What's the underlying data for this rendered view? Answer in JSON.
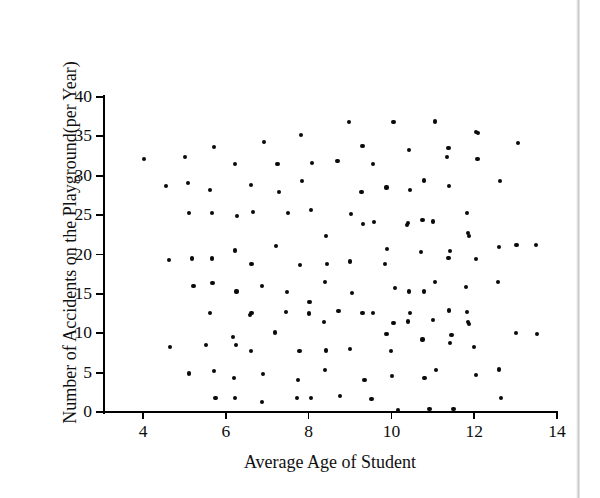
{
  "figure": {
    "background_color": "#ffffff",
    "ink_color": "#0a0a0a",
    "marker_shape": "filled-circle"
  },
  "chart_data": {
    "type": "scatter",
    "title": "",
    "subtitle": "",
    "xlabel": "Average Age of Student",
    "ylabel": "Number of Accidents on the Playground(per Year)",
    "xlim": [
      3.0,
      14.2
    ],
    "ylim": [
      0,
      40.5
    ],
    "xticks": [
      4,
      6,
      8,
      10,
      12,
      14
    ],
    "xtick_labels": [
      "4",
      "6",
      "8",
      "10",
      "12",
      "14"
    ],
    "yticks": [
      0,
      5,
      10,
      15,
      20,
      25,
      30,
      35,
      40
    ],
    "ytick_labels": [
      "0",
      "5",
      "10",
      "15",
      "20",
      "25",
      "30",
      "35",
      "40"
    ],
    "grid": false,
    "legend": null,
    "annotations": [],
    "relationship": "no apparent correlation",
    "n_points": 160,
    "points": [
      [
        4.02,
        32.1
      ],
      [
        4.55,
        28.7
      ],
      [
        4.62,
        19.3
      ],
      [
        4.66,
        8.3
      ],
      [
        5.02,
        32.4
      ],
      [
        5.08,
        29.1
      ],
      [
        5.12,
        25.3
      ],
      [
        5.18,
        19.5
      ],
      [
        5.22,
        16.0
      ],
      [
        5.12,
        4.9
      ],
      [
        5.52,
        8.5
      ],
      [
        5.62,
        12.6
      ],
      [
        5.68,
        16.4
      ],
      [
        5.62,
        28.2
      ],
      [
        5.66,
        25.3
      ],
      [
        5.72,
        33.6
      ],
      [
        5.66,
        19.5
      ],
      [
        5.72,
        5.2
      ],
      [
        5.75,
        1.8
      ],
      [
        6.22,
        31.5
      ],
      [
        6.28,
        24.9
      ],
      [
        6.22,
        20.5
      ],
      [
        6.26,
        15.3
      ],
      [
        6.18,
        9.5
      ],
      [
        6.25,
        8.5
      ],
      [
        6.2,
        4.3
      ],
      [
        6.22,
        1.8
      ],
      [
        6.6,
        28.8
      ],
      [
        6.65,
        25.4
      ],
      [
        6.62,
        18.8
      ],
      [
        6.58,
        12.3
      ],
      [
        6.62,
        12.6
      ],
      [
        6.6,
        7.7
      ],
      [
        6.92,
        34.3
      ],
      [
        6.88,
        16.0
      ],
      [
        6.9,
        4.8
      ],
      [
        6.88,
        1.3
      ],
      [
        7.25,
        31.5
      ],
      [
        7.28,
        27.9
      ],
      [
        7.22,
        21.1
      ],
      [
        7.18,
        10.1
      ],
      [
        7.5,
        25.3
      ],
      [
        7.48,
        15.2
      ],
      [
        7.45,
        12.7
      ],
      [
        7.82,
        35.2
      ],
      [
        7.85,
        29.3
      ],
      [
        7.8,
        18.7
      ],
      [
        7.78,
        7.7
      ],
      [
        7.75,
        4.1
      ],
      [
        7.72,
        1.8
      ],
      [
        8.08,
        31.6
      ],
      [
        8.05,
        25.6
      ],
      [
        8.02,
        14.0
      ],
      [
        8.0,
        12.5
      ],
      [
        8.05,
        1.8
      ],
      [
        8.42,
        22.4
      ],
      [
        8.45,
        18.8
      ],
      [
        8.4,
        16.5
      ],
      [
        8.38,
        11.4
      ],
      [
        8.42,
        7.8
      ],
      [
        8.4,
        5.3
      ],
      [
        8.7,
        31.9
      ],
      [
        8.72,
        12.8
      ],
      [
        8.75,
        2.0
      ],
      [
        8.98,
        36.8
      ],
      [
        9.02,
        25.1
      ],
      [
        9.0,
        19.1
      ],
      [
        9.05,
        15.1
      ],
      [
        9.0,
        8.0
      ],
      [
        9.3,
        33.8
      ],
      [
        9.28,
        27.9
      ],
      [
        9.32,
        23.9
      ],
      [
        9.3,
        12.6
      ],
      [
        9.35,
        4.1
      ],
      [
        9.55,
        31.5
      ],
      [
        9.58,
        24.1
      ],
      [
        9.55,
        12.6
      ],
      [
        9.52,
        1.6
      ],
      [
        9.88,
        28.5
      ],
      [
        9.9,
        20.7
      ],
      [
        9.85,
        18.8
      ],
      [
        9.88,
        9.9
      ],
      [
        10.05,
        36.8
      ],
      [
        10.08,
        15.7
      ],
      [
        10.05,
        11.3
      ],
      [
        10.0,
        7.7
      ],
      [
        10.02,
        4.6
      ],
      [
        10.15,
        0.3
      ],
      [
        10.42,
        33.3
      ],
      [
        10.45,
        28.2
      ],
      [
        10.4,
        24.0
      ],
      [
        10.38,
        23.7
      ],
      [
        10.42,
        15.3
      ],
      [
        10.45,
        12.6
      ],
      [
        10.4,
        11.5
      ],
      [
        10.78,
        29.4
      ],
      [
        10.75,
        24.4
      ],
      [
        10.72,
        20.3
      ],
      [
        10.78,
        15.3
      ],
      [
        10.75,
        9.2
      ],
      [
        10.8,
        4.3
      ],
      [
        10.92,
        0.4
      ],
      [
        11.05,
        36.9
      ],
      [
        11.0,
        24.2
      ],
      [
        11.05,
        16.5
      ],
      [
        11.0,
        11.7
      ],
      [
        11.08,
        5.3
      ],
      [
        11.38,
        33.5
      ],
      [
        11.35,
        32.4
      ],
      [
        11.4,
        28.7
      ],
      [
        11.42,
        20.4
      ],
      [
        11.38,
        19.6
      ],
      [
        11.4,
        12.9
      ],
      [
        11.45,
        9.8
      ],
      [
        11.42,
        8.8
      ],
      [
        11.5,
        0.4
      ],
      [
        11.82,
        25.3
      ],
      [
        11.85,
        22.7
      ],
      [
        11.88,
        22.4
      ],
      [
        11.8,
        15.9
      ],
      [
        11.82,
        12.7
      ],
      [
        11.85,
        11.4
      ],
      [
        11.88,
        11.2
      ],
      [
        12.05,
        35.6
      ],
      [
        12.1,
        35.4
      ],
      [
        12.08,
        32.1
      ],
      [
        12.05,
        19.4
      ],
      [
        12.0,
        8.3
      ],
      [
        12.05,
        4.7
      ],
      [
        12.62,
        29.3
      ],
      [
        12.6,
        21.0
      ],
      [
        12.58,
        16.5
      ],
      [
        12.6,
        5.4
      ],
      [
        12.65,
        1.8
      ],
      [
        13.05,
        34.2
      ],
      [
        13.02,
        21.2
      ],
      [
        13.0,
        10.0
      ],
      [
        13.5,
        21.2
      ],
      [
        13.52,
        9.9
      ]
    ]
  }
}
